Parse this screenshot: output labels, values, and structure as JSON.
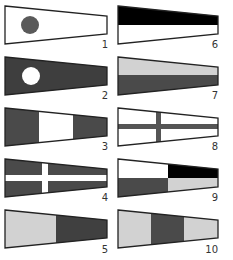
{
  "colors": {
    "black": "#000000",
    "white": "#ffffff",
    "dark": "#4a4a4a",
    "light": "#d2d2d2",
    "outline": "#222222"
  },
  "flags": [
    {
      "number": "1",
      "pattern": "white field with dark gray circle near hoist"
    },
    {
      "number": "2",
      "pattern": "dark gray field with white circle near hoist"
    },
    {
      "number": "3",
      "pattern": "three vertical bands: dark gray, white, dark gray"
    },
    {
      "number": "4",
      "pattern": "dark gray field with white cross"
    },
    {
      "number": "5",
      "pattern": "two vertical halves: light gray (hoist), dark gray (fly)"
    },
    {
      "number": "6",
      "pattern": "two horizontal halves: black (top), white (bottom)"
    },
    {
      "number": "7",
      "pattern": "two horizontal halves: light gray (top), dark gray (bottom)"
    },
    {
      "number": "8",
      "pattern": "white field with dark gray cross"
    },
    {
      "number": "9",
      "pattern": "quartered: white / black over dark gray / light gray"
    },
    {
      "number": "10",
      "pattern": "three vertical bands: light gray, dark gray, light gray"
    }
  ]
}
